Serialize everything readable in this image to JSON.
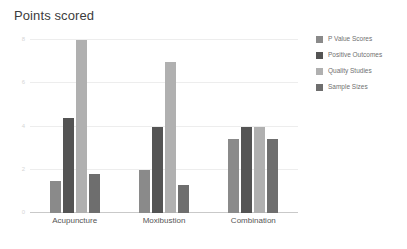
{
  "chart_data": {
    "type": "bar",
    "title": "Points scored",
    "xlabel": "",
    "ylabel": "",
    "categories": [
      "Acupuncture",
      "Moxibustion",
      "Combination"
    ],
    "series": [
      {
        "name": "P Value Scores",
        "color": "#8a8a8a",
        "values": [
          1.5,
          2.0,
          3.4
        ]
      },
      {
        "name": "Positive Outcomes",
        "color": "#545454",
        "values": [
          4.4,
          4.0,
          4.0
        ]
      },
      {
        "name": "Quality Studies",
        "color": "#b0b0b0",
        "values": [
          8.0,
          7.0,
          4.0
        ]
      },
      {
        "name": "Sample Sizes",
        "color": "#6e6e6e",
        "values": [
          1.8,
          1.3,
          3.4
        ]
      }
    ],
    "ylim": [
      0,
      8
    ],
    "yticks": [
      0,
      2,
      4,
      6,
      8
    ],
    "ytick_labels": [
      "0",
      "2",
      "4",
      "6",
      "8"
    ],
    "grid": true,
    "legend_position": "right"
  }
}
